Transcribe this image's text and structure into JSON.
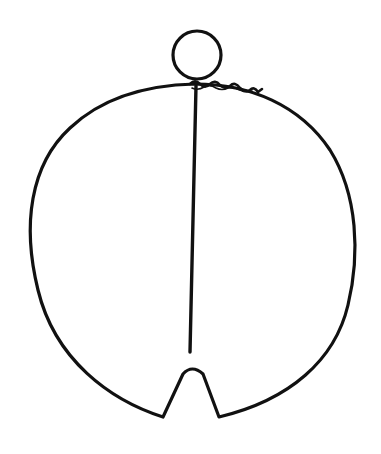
{
  "figure": {
    "background_color": "#ffffff",
    "line_color": "#111111",
    "parts": [
      {
        "name": "hanging-loop",
        "shape": "circle",
        "center": [
          197,
          55
        ],
        "radius": 24
      },
      {
        "name": "outer-hoop",
        "shape": "closed-curve",
        "left_x": 29,
        "right_x": 356,
        "top_y": 84,
        "bottom_y": 417
      },
      {
        "name": "bottom-notch",
        "shape": "v-notch",
        "apex": [
          192,
          370
        ],
        "base_left": [
          163,
          417
        ],
        "base_right": [
          219,
          417
        ]
      },
      {
        "name": "center-wire",
        "shape": "line",
        "from": [
          196,
          86
        ],
        "to": [
          190,
          352
        ]
      },
      {
        "name": "twisted-wrap",
        "shape": "coil",
        "from": [
          195,
          86
        ],
        "to": [
          262,
          95
        ]
      }
    ]
  }
}
